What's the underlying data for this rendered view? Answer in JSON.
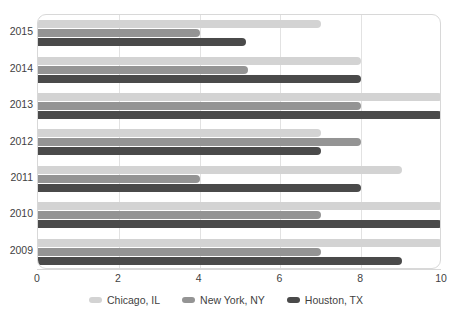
{
  "chart_data": {
    "type": "bar",
    "orientation": "horizontal",
    "title": "",
    "xlabel": "",
    "ylabel": "",
    "xlim": [
      0,
      10
    ],
    "xticks": [
      0,
      2,
      4,
      6,
      8,
      10
    ],
    "xtick_labels": [
      "0",
      "2",
      "4",
      "6",
      "8",
      "10"
    ],
    "grid": true,
    "grid_axis": "x",
    "legend_position": "bottom",
    "categories": [
      "2015",
      "2014",
      "2013",
      "2012",
      "2011",
      "2010",
      "2009"
    ],
    "series": [
      {
        "name": "Chicago, IL",
        "color": "#d3d3d3",
        "values": [
          7,
          8,
          10,
          7,
          9,
          10,
          10
        ]
      },
      {
        "name": "New York, NY",
        "color": "#949494",
        "values": [
          4,
          5.2,
          8,
          8,
          4,
          7,
          7
        ]
      },
      {
        "name": "Houston, TX",
        "color": "#4a4a4a",
        "values": [
          5.15,
          8,
          10,
          7,
          8,
          10,
          9
        ]
      }
    ]
  },
  "legend": {
    "items": [
      {
        "label": "Chicago, IL",
        "swatch": "legend-swatch-chicago"
      },
      {
        "label": "New York, NY",
        "swatch": "legend-swatch-new-york"
      },
      {
        "label": "Houston, TX",
        "swatch": "legend-swatch-houston"
      }
    ]
  }
}
